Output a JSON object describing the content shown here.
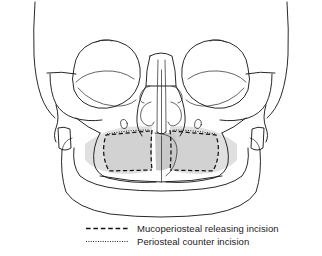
{
  "figure": {
    "view": "frontal",
    "background_color": "#ffffff",
    "line_color": "#111111",
    "flap_shade_color": "#d2d2d2",
    "halo_shade_color": "#dedede",
    "premaxilla_shade_color": "#c9c9c9"
  },
  "legend": {
    "entries": [
      {
        "label": "Mucoperiosteal releasing incision",
        "line_style": "dashed",
        "color": "#111111",
        "icon": "dashed-line-icon"
      },
      {
        "label": "Periosteal counter incision",
        "line_style": "dotted",
        "color": "#111111",
        "icon": "dotted-line-icon"
      }
    ]
  },
  "anatomy": {
    "structures": [
      "frontal bone",
      "left orbit",
      "right orbit",
      "nasal aperture",
      "nasal septum",
      "inferior turbinate",
      "middle turbinate",
      "left zygomatic arch",
      "right zygomatic arch",
      "left infraorbital foramen",
      "right infraorbital foramen",
      "maxilla",
      "premaxilla",
      "mandible"
    ],
    "annotations": {
      "left_flap": "Mucoperiosteal releasing incision",
      "right_flap": "Mucoperiosteal releasing incision",
      "left_counter": "Periosteal counter incision",
      "right_counter": "Periosteal counter incision"
    }
  }
}
